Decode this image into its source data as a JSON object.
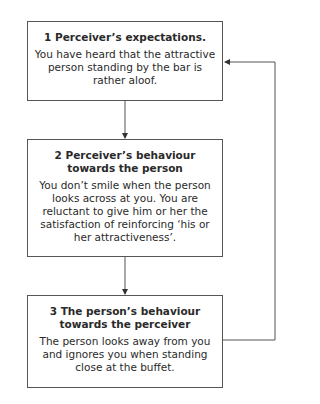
{
  "diagram": {
    "boxes": [
      {
        "title": "1 Perceiver’s expectations.",
        "body": "You have heard that the attractive person standing by the bar is rather aloof."
      },
      {
        "title": "2 Perceiver’s behaviour towards the person",
        "body": "You don’t smile when the person looks across at you. You are reluctant to give him or her the satisfaction of reinforcing ‘his or her attractiveness’."
      },
      {
        "title": "3 The person’s behaviour towards the perceiver",
        "body": "The person looks away from you and ignores you when standing close at the buffet."
      }
    ],
    "connectors": [
      {
        "from": 1,
        "to": 2,
        "type": "arrow-down"
      },
      {
        "from": 2,
        "to": 3,
        "type": "arrow-down"
      },
      {
        "from": 3,
        "to": 1,
        "type": "feedback-loop-right"
      }
    ],
    "colors": {
      "line": "#555555",
      "text": "#2a2a2a",
      "background": "#ffffff"
    }
  }
}
